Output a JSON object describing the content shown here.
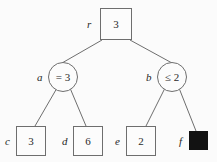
{
  "figure": {
    "type": "game-tree-diagram",
    "background_color": "#fbfbfb",
    "stroke_color": "#6e6e6e",
    "text_color": "#2b2b2b",
    "fill_color": "#121212"
  },
  "nodes": [
    {
      "id": "r",
      "label": "r",
      "value": "3",
      "shape": "square",
      "filled": false,
      "x": 100,
      "y": 8,
      "w": 32,
      "h": 32,
      "label_x": 87,
      "label_y": 19
    },
    {
      "id": "a",
      "label": "a",
      "value": "= 3",
      "shape": "circle",
      "filled": false,
      "x": 48,
      "y": 62,
      "w": 30,
      "h": 30,
      "label_x": 37,
      "label_y": 72
    },
    {
      "id": "b",
      "label": "b",
      "value": "≤ 2",
      "shape": "circle",
      "filled": false,
      "x": 157,
      "y": 62,
      "w": 30,
      "h": 30,
      "label_x": 146,
      "label_y": 72
    },
    {
      "id": "c",
      "label": "c",
      "value": "3",
      "shape": "square",
      "filled": false,
      "x": 16,
      "y": 126,
      "w": 30,
      "h": 30,
      "label_x": 5,
      "label_y": 136
    },
    {
      "id": "d",
      "label": "d",
      "value": "6",
      "shape": "square",
      "filled": false,
      "x": 73,
      "y": 126,
      "w": 30,
      "h": 30,
      "label_x": 62,
      "label_y": 136
    },
    {
      "id": "e",
      "label": "e",
      "value": "2",
      "shape": "square",
      "filled": false,
      "x": 126,
      "y": 126,
      "w": 30,
      "h": 30,
      "label_x": 115,
      "label_y": 136
    },
    {
      "id": "f",
      "label": "f",
      "value": "",
      "shape": "square",
      "filled": true,
      "x": 189,
      "y": 131,
      "w": 19,
      "h": 19,
      "label_x": 179,
      "label_y": 136
    }
  ],
  "edges": [
    {
      "from": "r",
      "to": "a",
      "x1": 102,
      "y1": 40,
      "x2": 62,
      "y2": 63
    },
    {
      "from": "r",
      "to": "b",
      "x1": 130,
      "y1": 40,
      "x2": 172,
      "y2": 63
    },
    {
      "from": "a",
      "to": "c",
      "x1": 57,
      "y1": 88,
      "x2": 35,
      "y2": 126
    },
    {
      "from": "a",
      "to": "d",
      "x1": 70,
      "y1": 88,
      "x2": 86,
      "y2": 126
    },
    {
      "from": "b",
      "to": "e",
      "x1": 165,
      "y1": 88,
      "x2": 146,
      "y2": 126
    },
    {
      "from": "b",
      "to": "f",
      "x1": 179,
      "y1": 88,
      "x2": 196,
      "y2": 131
    }
  ]
}
